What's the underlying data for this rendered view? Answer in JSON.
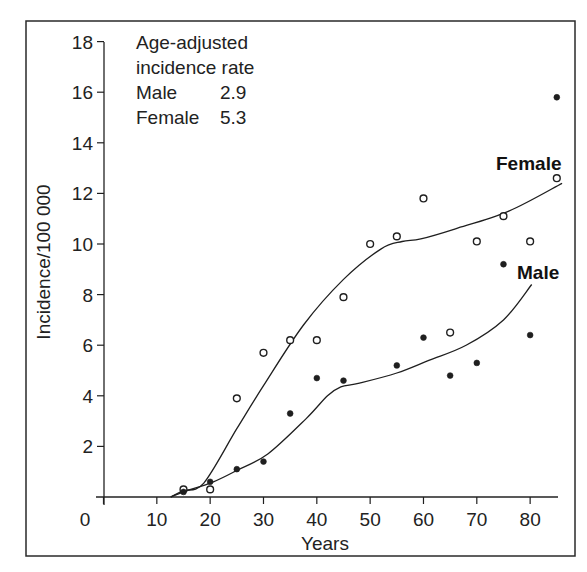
{
  "chart_data": {
    "type": "scatter",
    "title": "",
    "xlabel": "Years",
    "ylabel": "Incidence/100 000",
    "xlim": [
      0,
      85
    ],
    "ylim": [
      0,
      18
    ],
    "x_ticks": [
      0,
      10,
      20,
      30,
      40,
      50,
      60,
      70,
      80
    ],
    "y_ticks": [
      2,
      4,
      6,
      8,
      10,
      12,
      14,
      16,
      18
    ],
    "grid": false,
    "legend": "inline labels next to curves",
    "annotation": {
      "lines": [
        "Age-adjusted",
        "incidence rate",
        "Male",
        "Female"
      ],
      "values": {
        "Male": "2.9",
        "Female": "5.3"
      }
    },
    "series": [
      {
        "name": "Female",
        "marker": "open-circle",
        "points": [
          [
            15,
            0.3
          ],
          [
            20,
            0.3
          ],
          [
            25,
            3.9
          ],
          [
            30,
            5.7
          ],
          [
            35,
            6.2
          ],
          [
            40,
            6.2
          ],
          [
            45,
            7.9
          ],
          [
            50,
            10.0
          ],
          [
            55,
            10.3
          ],
          [
            60,
            11.8
          ],
          [
            65,
            6.5
          ],
          [
            70,
            10.1
          ],
          [
            75,
            11.1
          ],
          [
            80,
            10.1
          ],
          [
            85,
            12.6
          ]
        ],
        "fitted_curve": [
          [
            12.6,
            0
          ],
          [
            15,
            0.25
          ],
          [
            18.8,
            0.55
          ],
          [
            25,
            2.7
          ],
          [
            30,
            4.4
          ],
          [
            37.5,
            6.8
          ],
          [
            45,
            8.6
          ],
          [
            52,
            9.8
          ],
          [
            56,
            10.1
          ],
          [
            59.5,
            10.2
          ],
          [
            66,
            10.6
          ],
          [
            76,
            11.3
          ],
          [
            86,
            12.4
          ]
        ],
        "label_text": "Female"
      },
      {
        "name": "Male",
        "marker": "filled-circle",
        "points": [
          [
            15,
            0.2
          ],
          [
            20,
            0.6
          ],
          [
            25,
            1.1
          ],
          [
            30,
            1.4
          ],
          [
            35,
            3.3
          ],
          [
            40,
            4.7
          ],
          [
            45,
            4.6
          ],
          [
            55,
            5.2
          ],
          [
            60,
            6.3
          ],
          [
            65,
            4.8
          ],
          [
            70,
            5.3
          ],
          [
            75,
            9.2
          ],
          [
            80,
            6.4
          ],
          [
            85,
            15.8
          ]
        ],
        "fitted_curve": [
          [
            12.6,
            0
          ],
          [
            15,
            0.2
          ],
          [
            20.6,
            0.6
          ],
          [
            25,
            1.05
          ],
          [
            30.8,
            1.7
          ],
          [
            38,
            3.1
          ],
          [
            42,
            4.0
          ],
          [
            44.5,
            4.35
          ],
          [
            48,
            4.5
          ],
          [
            55,
            4.9
          ],
          [
            61,
            5.4
          ],
          [
            68,
            6.0
          ],
          [
            75,
            7.0
          ],
          [
            80.3,
            8.4
          ]
        ],
        "label_text": "Male"
      }
    ]
  },
  "labels": {
    "x_axis_title": "Years",
    "y_axis_title": "Incidence/100 000",
    "note_line1": "Age-adjusted",
    "note_line2": "incidence rate",
    "note_male_label": "Male",
    "note_male_value": "2.9",
    "note_female_label": "Female",
    "note_female_value": "5.3",
    "female_series_label": "Female",
    "male_series_label": "Male",
    "x_tick_labels": [
      "0",
      "10",
      "20",
      "30",
      "40",
      "50",
      "60",
      "70",
      "80"
    ],
    "y_tick_labels": [
      "2",
      "4",
      "6",
      "8",
      "10",
      "12",
      "14",
      "16",
      "18"
    ]
  },
  "colors": {
    "ink": "#1f1f1f",
    "background": "#ffffff"
  }
}
